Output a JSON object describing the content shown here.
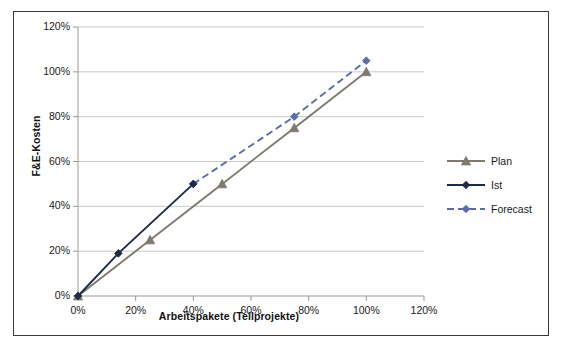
{
  "chart_data": {
    "type": "line",
    "title": "",
    "xlabel": "Arbeitspakete (Teilprojekte)",
    "ylabel": "F&E-Kosten",
    "xlim": [
      0,
      120
    ],
    "ylim": [
      0,
      120
    ],
    "xticks": [
      "0%",
      "20%",
      "40%",
      "60%",
      "80%",
      "100%",
      "120%"
    ],
    "yticks": [
      "0%",
      "20%",
      "40%",
      "60%",
      "80%",
      "100%",
      "120%"
    ],
    "xtick_values": [
      0,
      20,
      40,
      60,
      80,
      100,
      120
    ],
    "ytick_values": [
      0,
      20,
      40,
      60,
      80,
      100,
      120
    ],
    "grid": "horizontal",
    "legend_position": "right",
    "series": [
      {
        "name": "Plan",
        "color": "#7f7a6e",
        "style": "solid",
        "marker": "triangle",
        "x": [
          0,
          25,
          50,
          75,
          100
        ],
        "y": [
          0,
          25,
          50,
          75,
          100
        ]
      },
      {
        "name": "Ist",
        "color": "#1f2a4a",
        "style": "solid",
        "marker": "diamond",
        "x": [
          0,
          14,
          40
        ],
        "y": [
          0,
          19,
          50
        ]
      },
      {
        "name": "Forecast",
        "color": "#5b6ca8",
        "style": "dashed",
        "marker": "diamond",
        "x": [
          40,
          75,
          100
        ],
        "y": [
          50,
          80,
          105
        ]
      }
    ]
  },
  "legend": {
    "items": [
      {
        "label": "Plan"
      },
      {
        "label": "Ist"
      },
      {
        "label": "Forecast"
      }
    ]
  },
  "axes": {
    "y_title": "F&E-Kosten",
    "x_title": "Arbeitspakete (Teilprojekte)"
  },
  "colors": {
    "plan": "#7f7a6e",
    "ist": "#1f2a4a",
    "forecast": "#5b6ca8",
    "grid": "#c9c9c9",
    "axis": "#9a9a94",
    "frame": "#3b3b3b"
  }
}
